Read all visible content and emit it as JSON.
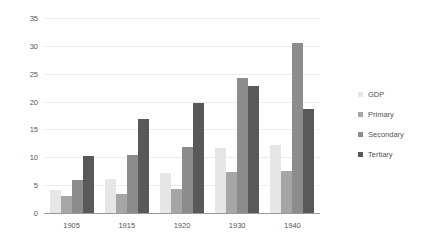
{
  "chart_data": {
    "type": "bar",
    "title": "",
    "subtitle": "",
    "xlabel": "",
    "ylabel": "GDP per worker in 1,000 Yen",
    "categories": [
      "1905",
      "1915",
      "1920",
      "1930",
      "1940"
    ],
    "series": [
      {
        "name": "GDP",
        "color": "#e6e6e6",
        "values": [
          4.2,
          6.1,
          7.1,
          11.6,
          12.2
        ]
      },
      {
        "name": "Primary",
        "color": "#a6a6a6",
        "values": [
          3.0,
          3.4,
          4.3,
          7.4,
          7.5
        ]
      },
      {
        "name": "Secondary",
        "color": "#8c8c8c",
        "values": [
          5.9,
          10.5,
          11.8,
          24.2,
          30.6
        ]
      },
      {
        "name": "Tertiary",
        "color": "#595959",
        "values": [
          10.3,
          16.9,
          19.7,
          22.8,
          18.6
        ]
      }
    ],
    "ylim": [
      0,
      35
    ],
    "yticks": [
      0,
      5,
      10,
      15,
      20,
      25,
      30,
      35
    ],
    "ytick_labels": [
      "0",
      "5",
      "10",
      "15",
      "20",
      "25",
      "30",
      "35"
    ],
    "grid": true,
    "grid_axis": "y",
    "legend_position": "right",
    "legend_entries": [
      "GDP",
      "Primary",
      "Secondary",
      "Tertiary"
    ],
    "background_color": "#ffffff",
    "gridline_color": "#ededed",
    "axis_color": "#9a9a9a",
    "text_color": "#555555"
  }
}
